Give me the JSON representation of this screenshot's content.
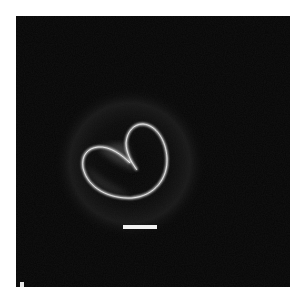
{
  "image": {
    "subject": "phase-contrast micrograph of a heart-shaped cell",
    "background_color": "#060606",
    "frame_color": "#ffffff",
    "scale_bar": {
      "label": "",
      "color": "#f2f2f2"
    }
  }
}
